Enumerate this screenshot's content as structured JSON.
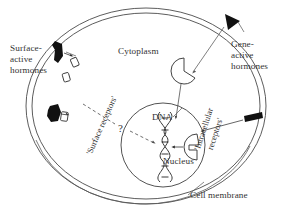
{
  "figure": {
    "background_color": "#ffffff",
    "line_color": "#4a4a4a",
    "text_color": "#333333",
    "hormone_fill": "#111111"
  },
  "labels": {
    "cytoplasm": "Cytoplasm",
    "nucleus": "Nucleus",
    "dna": "DNA",
    "cell_membrane": "Cell membrane",
    "surface_active_hormones": "Surface-\nactive\nhormones",
    "gene_active_hormones": "Gene-\nactive\nhormones",
    "surface_receptors": "'Surface receptors'",
    "intracellular_receptors_line1": "'Intracellular",
    "intracellular_receptors_line2": "receptors'",
    "question_mark": "?"
  },
  "structures": {
    "cell_membrane": {
      "shape": "ellipse-double-line",
      "description": "outer cell boundary drawn as two concentric curved lines"
    },
    "nucleus": {
      "shape": "circle",
      "contains": [
        "DNA double helix",
        "intracellular receptor"
      ]
    },
    "dna": {
      "shape": "double-helix",
      "turns": 4
    },
    "surface_receptor_sites": 3,
    "intracellular_receptors": 2,
    "hormone_markers": {
      "surface_active": 2,
      "gene_active": 2
    }
  },
  "pathways": [
    {
      "name": "surface-active-binding",
      "style": "solid-arrow",
      "from": "surface-active hormones",
      "to": "surface receptors"
    },
    {
      "name": "unknown-signal-transduction",
      "style": "dashed-arrow",
      "from": "surface receptors",
      "to": "DNA",
      "annotation": "?"
    },
    {
      "name": "gene-active-entry",
      "style": "solid-arrow",
      "from": "gene-active hormones",
      "to": "intracellular receptors"
    },
    {
      "name": "receptor-to-dna",
      "style": "solid-arrow",
      "from": "intracellular receptor",
      "to": "DNA"
    }
  ]
}
